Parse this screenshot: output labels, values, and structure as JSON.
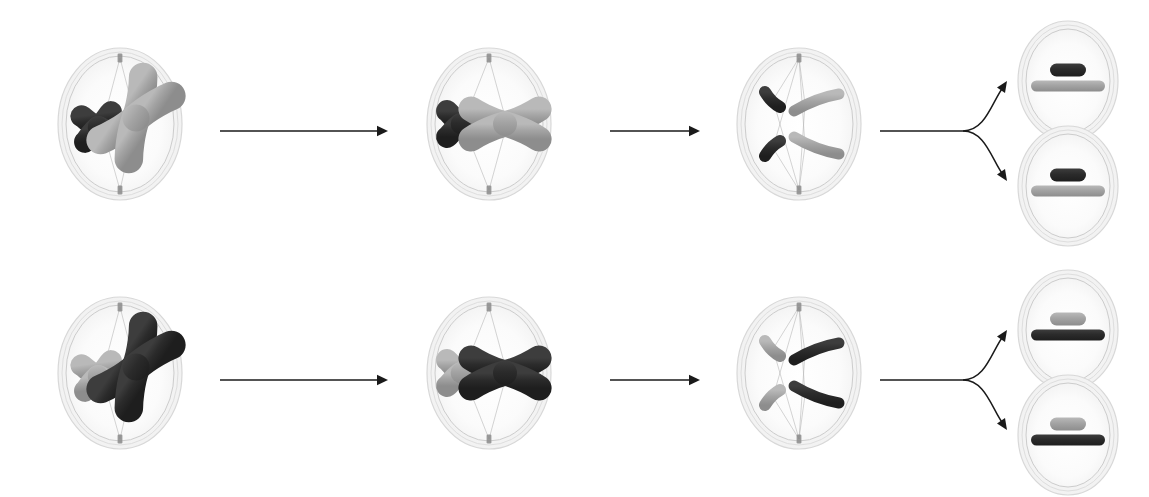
{
  "diagram": {
    "type": "biology-cell-division-sequence",
    "background_color": "#ffffff",
    "rows": [
      {
        "id": "row-top",
        "name": "arrangement-1",
        "y": 0,
        "chromosome_pair_a_color": "#2b2b2b",
        "chromosome_pair_b_color": "#a0a0a0",
        "stages": [
          {
            "id": "top-prophase",
            "stage_name": "prophase",
            "cx": 120,
            "cy": 124,
            "rx": 62,
            "ry": 76,
            "chromosomes": [
              {
                "name": "short-chromosome",
                "shape": "x-shaped",
                "color": "#2b2b2b",
                "size": "short"
              },
              {
                "name": "long-chromosome",
                "shape": "x-shaped",
                "color": "#a0a0a0",
                "size": "long"
              }
            ]
          },
          {
            "id": "top-metaphase",
            "stage_name": "metaphase",
            "cx": 489,
            "cy": 124,
            "rx": 62,
            "ry": 76,
            "chromosomes": [
              {
                "name": "short-chromosome",
                "shape": "x-shaped",
                "color": "#2b2b2b",
                "size": "short"
              },
              {
                "name": "long-chromosome",
                "shape": "x-shaped",
                "color": "#a0a0a0",
                "size": "long"
              }
            ]
          },
          {
            "id": "top-anaphase",
            "stage_name": "anaphase",
            "cx": 799,
            "cy": 124,
            "rx": 62,
            "ry": 76,
            "chromosomes": [
              {
                "name": "short-chromatid-upper",
                "shape": "bent-rod",
                "color": "#2b2b2b",
                "size": "short"
              },
              {
                "name": "long-chromatid-upper",
                "shape": "bent-rod",
                "color": "#a0a0a0",
                "size": "long"
              },
              {
                "name": "short-chromatid-lower",
                "shape": "bent-rod",
                "color": "#2b2b2b",
                "size": "short"
              },
              {
                "name": "long-chromatid-lower",
                "shape": "bent-rod",
                "color": "#a0a0a0",
                "size": "long"
              }
            ]
          }
        ],
        "daughter_cells": [
          {
            "id": "top-daughter-upper",
            "cx": 1068,
            "cy": 81,
            "rx": 50,
            "ry": 60,
            "chromosomes": [
              {
                "name": "short-chromosome",
                "color": "#2b2b2b",
                "size": "short",
                "position": "upper"
              },
              {
                "name": "long-chromosome",
                "color": "#a0a0a0",
                "size": "long",
                "position": "lower"
              }
            ]
          },
          {
            "id": "top-daughter-lower",
            "cx": 1068,
            "cy": 186,
            "rx": 50,
            "ry": 60,
            "chromosomes": [
              {
                "name": "short-chromosome",
                "color": "#2b2b2b",
                "size": "short",
                "position": "upper"
              },
              {
                "name": "long-chromosome",
                "color": "#a0a0a0",
                "size": "long",
                "position": "lower"
              }
            ]
          }
        ],
        "arrows": [
          {
            "id": "top-arrow-1",
            "kind": "straight",
            "x1": 220,
            "y1": 131,
            "x2": 388,
            "y2": 131
          },
          {
            "id": "top-arrow-2",
            "kind": "straight",
            "x1": 610,
            "y1": 131,
            "x2": 700,
            "y2": 131
          },
          {
            "id": "top-arrow-branch",
            "kind": "branching",
            "x": 880,
            "y": 131
          }
        ]
      },
      {
        "id": "row-bottom",
        "name": "arrangement-2",
        "y": 249,
        "chromosome_pair_a_color": "#a0a0a0",
        "chromosome_pair_b_color": "#2b2b2b",
        "stages": [
          {
            "id": "bottom-prophase",
            "stage_name": "prophase",
            "cx": 120,
            "cy": 124,
            "rx": 62,
            "ry": 76,
            "chromosomes": [
              {
                "name": "short-chromosome",
                "shape": "x-shaped",
                "color": "#a0a0a0",
                "size": "short"
              },
              {
                "name": "long-chromosome",
                "shape": "x-shaped",
                "color": "#2b2b2b",
                "size": "long"
              }
            ]
          },
          {
            "id": "bottom-metaphase",
            "stage_name": "metaphase",
            "cx": 489,
            "cy": 124,
            "rx": 62,
            "ry": 76,
            "chromosomes": [
              {
                "name": "short-chromosome",
                "shape": "x-shaped",
                "color": "#a0a0a0",
                "size": "short"
              },
              {
                "name": "long-chromosome",
                "shape": "x-shaped",
                "color": "#2b2b2b",
                "size": "long"
              }
            ]
          },
          {
            "id": "bottom-anaphase",
            "stage_name": "anaphase",
            "cx": 799,
            "cy": 124,
            "rx": 62,
            "ry": 76,
            "chromosomes": [
              {
                "name": "short-chromatid-upper",
                "shape": "bent-rod",
                "color": "#a0a0a0",
                "size": "short"
              },
              {
                "name": "long-chromatid-upper",
                "shape": "bent-rod",
                "color": "#2b2b2b",
                "size": "long"
              },
              {
                "name": "short-chromatid-lower",
                "shape": "bent-rod",
                "color": "#a0a0a0",
                "size": "short"
              },
              {
                "name": "long-chromatid-lower",
                "shape": "bent-rod",
                "color": "#2b2b2b",
                "size": "long"
              }
            ]
          }
        ],
        "daughter_cells": [
          {
            "id": "bottom-daughter-upper",
            "cx": 1068,
            "cy": 81,
            "rx": 50,
            "ry": 60,
            "chromosomes": [
              {
                "name": "short-chromosome",
                "color": "#a0a0a0",
                "size": "short",
                "position": "upper"
              },
              {
                "name": "long-chromosome",
                "color": "#2b2b2b",
                "size": "long",
                "position": "lower"
              }
            ]
          },
          {
            "id": "bottom-daughter-lower",
            "cx": 1068,
            "cy": 186,
            "rx": 50,
            "ry": 60,
            "chromosomes": [
              {
                "name": "short-chromosome",
                "color": "#a0a0a0",
                "size": "short",
                "position": "upper"
              },
              {
                "name": "long-chromosome",
                "color": "#2b2b2b",
                "size": "long",
                "position": "lower"
              }
            ]
          }
        ],
        "arrows": [
          {
            "id": "bottom-arrow-1",
            "kind": "straight",
            "x1": 220,
            "y1": 131,
            "x2": 388,
            "y2": 131
          },
          {
            "id": "bottom-arrow-2",
            "kind": "straight",
            "x1": 610,
            "y1": 131,
            "x2": 700,
            "y2": 131
          },
          {
            "id": "bottom-arrow-branch",
            "kind": "branching",
            "x": 880,
            "y": 131
          }
        ]
      }
    ],
    "palette": {
      "cell_membrane_stroke": "#d8d8d8",
      "cell_membrane_inner_stroke": "#cccccc",
      "cytoplasm_fill": "#f7f7f7",
      "cytoplasm_inner_fill": "#fcfcfc",
      "spindle_fiber": "#b8b8b8",
      "centrosome": "#8a8a8a",
      "arrow_color": "#1a1a1a",
      "chromosome_dark": "#2b2b2b",
      "chromosome_light": "#a0a0a0",
      "chromosome_light_highlight": "#c9c9c9",
      "chromosome_dark_highlight": "#4a4a4a"
    }
  }
}
